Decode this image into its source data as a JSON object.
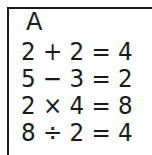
{
  "card": {
    "label": "A",
    "equations": [
      "2 + 2 = 4",
      "5 − 3 = 2",
      "2 × 4 = 8",
      "8 ÷ 2 = 4"
    ]
  }
}
